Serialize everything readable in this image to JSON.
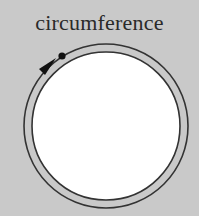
{
  "diagram": {
    "title": "circumference",
    "colors": {
      "background": "#c9c9c9",
      "ring": "#c9c9c9",
      "inner_fill": "#ffffff",
      "stroke": "#333333",
      "marker": "#111111"
    },
    "shapes": {
      "center": [
        106,
        126
      ],
      "outer_radius": 82,
      "inner_radius": 74
    }
  }
}
